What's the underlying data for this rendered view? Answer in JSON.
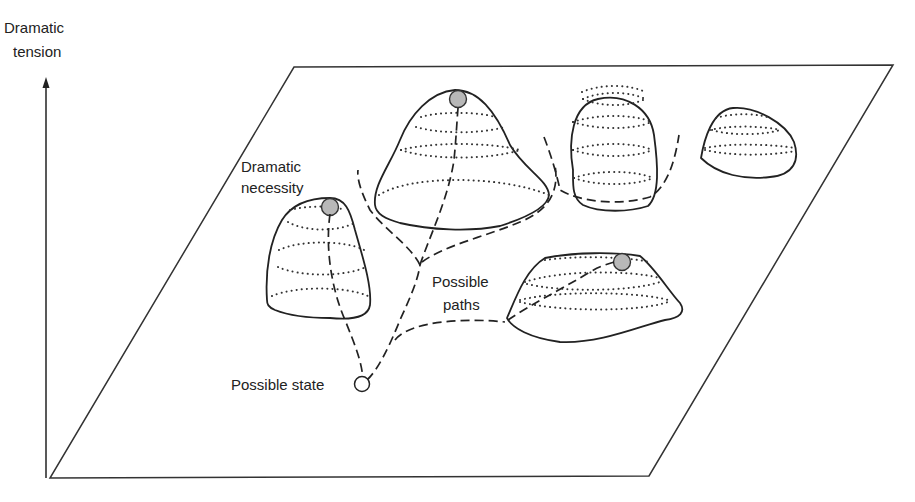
{
  "figure": {
    "axis": {
      "label_line1": "Dramatic",
      "label_line2": "tension",
      "direction": "up"
    },
    "plane": {
      "label": "state space"
    },
    "labels": {
      "dramatic_necessity_line1": "Dramatic",
      "dramatic_necessity_line2": "necessity",
      "possible_paths_line1": "Possible",
      "possible_paths_line2": "paths",
      "possible_state": "Possible state"
    },
    "peaks": [
      {
        "id": "left-peak",
        "has_marker": true
      },
      {
        "id": "center-tall-peak",
        "has_marker": true
      },
      {
        "id": "center-right-peak",
        "has_marker": false
      },
      {
        "id": "far-right-peak",
        "has_marker": false
      },
      {
        "id": "lower-right-flat-peak",
        "has_marker": true
      }
    ],
    "colors": {
      "line": "#222222",
      "marker_fill": "#b8b8b8",
      "background": "#ffffff"
    }
  }
}
